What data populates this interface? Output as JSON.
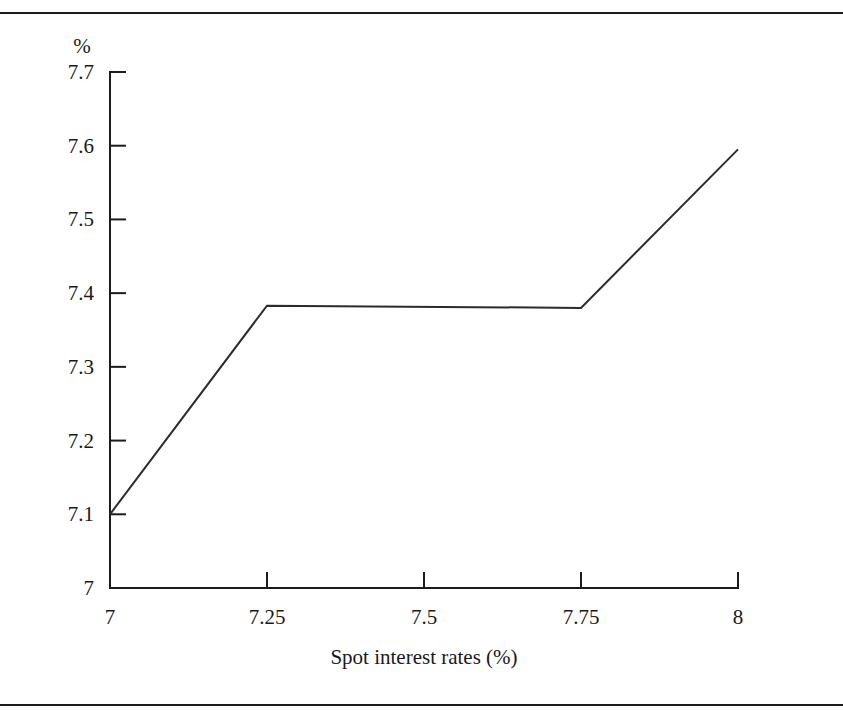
{
  "figure": {
    "background_color": "#ffffff",
    "line_color": "#2b2b2b",
    "axis_color": "#1c1c1c",
    "top_rule": "",
    "bottom_rule": ""
  },
  "labels": {
    "unit": "%",
    "x_axis_title": "Spot interest rates (%)"
  },
  "chart_data": {
    "type": "line",
    "title": "",
    "subtitle": "",
    "xlabel": "Spot interest rates (%)",
    "ylabel": "%",
    "xlim": [
      7,
      8
    ],
    "ylim": [
      7,
      7.7
    ],
    "xticks": [
      7,
      7.25,
      7.5,
      7.75,
      8
    ],
    "xticklabels": [
      "7",
      "7.25",
      "7.5",
      "7.75",
      "8"
    ],
    "yticks": [
      7,
      7.1,
      7.2,
      7.3,
      7.4,
      7.5,
      7.6,
      7.7
    ],
    "yticklabels": [
      "7",
      "7.1",
      "7.2",
      "7.3",
      "7.4",
      "7.5",
      "7.6",
      "7.7"
    ],
    "grid": false,
    "legend": false,
    "legend_position": "none",
    "series": [
      {
        "name": "Portfolio value",
        "x": [
          7,
          7.25,
          7.75,
          8
        ],
        "y": [
          7.1,
          7.383,
          7.38,
          7.595
        ]
      }
    ]
  }
}
